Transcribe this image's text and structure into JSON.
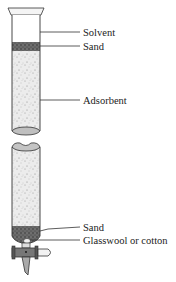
{
  "diagram": {
    "labels": {
      "solvent": "Solvent",
      "sand_top": "Sand",
      "adsorbent": "Adsorbent",
      "sand_bottom": "Sand",
      "glasswool": "Glasswool or cotton"
    },
    "colors": {
      "outline": "#333333",
      "sand": "#555555",
      "adsorbent": "#e6e6e6",
      "leader": "#333333"
    }
  }
}
